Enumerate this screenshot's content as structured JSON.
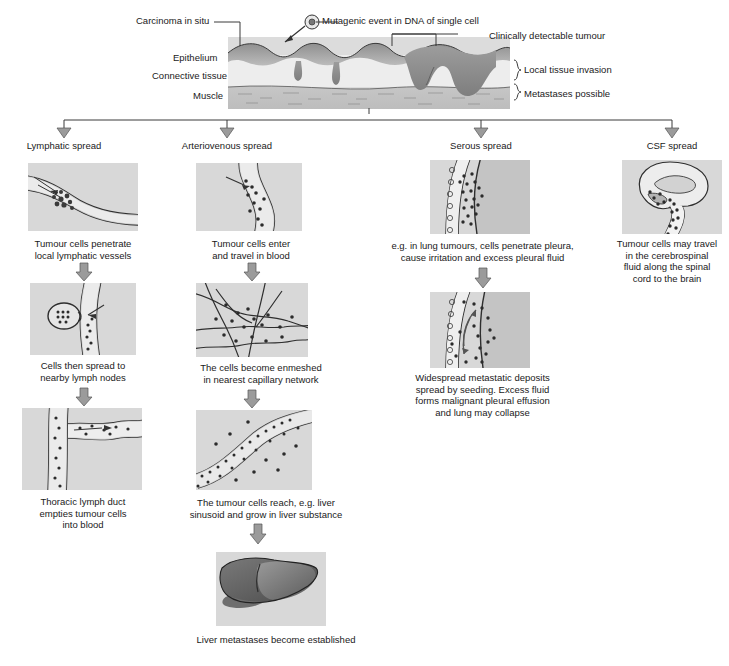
{
  "diagram": {
    "top_panel": {
      "labels_left": [
        {
          "text": "Epithelium"
        },
        {
          "text": "Connective tissue"
        },
        {
          "text": "Muscle"
        }
      ],
      "annotations": [
        {
          "text": "Carcinoma in situ"
        },
        {
          "text": "Mutagenic event in DNA of single cell"
        },
        {
          "text": "Clinically detectable tumour"
        }
      ],
      "brackets": [
        {
          "text": "Local tissue invasion"
        },
        {
          "text": "Metastases possible"
        }
      ]
    },
    "columns": [
      {
        "header": "Lymphatic spread",
        "steps": [
          {
            "caption": "Tumour cells penetrate\nlocal lymphatic vessels",
            "icon": "lymphatic-vessel-illustration"
          },
          {
            "caption": "Cells then spread to\nnearby lymph nodes",
            "icon": "lymph-node-illustration"
          },
          {
            "caption": "Thoracic lymph duct\nempties tumour cells\ninto blood",
            "icon": "thoracic-duct-illustration"
          }
        ]
      },
      {
        "header": "Arteriovenous spread",
        "steps": [
          {
            "caption": "Tumour cells enter\nand travel in blood",
            "icon": "blood-vessel-illustration"
          },
          {
            "caption": "The cells become enmeshed\nin nearest capillary network",
            "icon": "capillary-network-illustration"
          },
          {
            "caption": "The tumour cells reach, e.g. liver\nsinusoid and grow in liver substance",
            "icon": "liver-sinusoid-illustration"
          },
          {
            "caption": "Liver metastases become established",
            "icon": "liver-illustration"
          }
        ]
      },
      {
        "header": "Serous spread",
        "steps": [
          {
            "caption": "e.g. in lung tumours, cells penetrate pleura,\ncause irritation and excess pleural fluid",
            "icon": "pleura-illustration"
          },
          {
            "caption": "Widespread metastatic deposits\nspread by seeding. Excess fluid\nforms malignant pleural effusion\nand lung may collapse",
            "icon": "pleural-effusion-illustration"
          }
        ]
      },
      {
        "header": "CSF spread",
        "steps": [
          {
            "caption": "Tumour cells may travel\nin the cerebrospinal\nfluid along the spinal\ncord to the brain",
            "icon": "brain-spinal-cord-illustration"
          }
        ]
      }
    ],
    "colors": {
      "panel_bg": "#d8d8d8",
      "ink": "#3a3a3a",
      "tumour_fill": "#9a9a9a",
      "arrow_fill": "#a8a8a8"
    }
  }
}
